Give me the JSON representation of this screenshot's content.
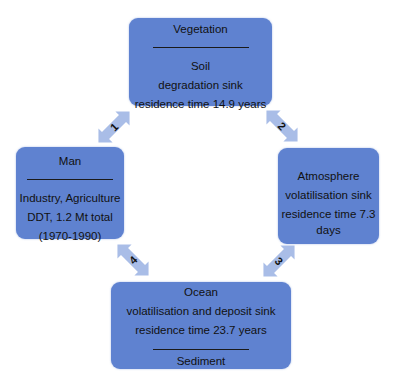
{
  "diagram": {
    "colors": {
      "box_fill": "#5f82d0",
      "arrow_fill": "#a9bde7",
      "text": "#111111"
    },
    "nodes": {
      "vegetation": {
        "title": "Vegetation",
        "lines": [
          "Soil",
          "degradation sink",
          "residence time 14.9 years"
        ]
      },
      "man": {
        "title": "Man",
        "lines": [
          "Industry, Agriculture",
          "DDT, 1.2 Mt total",
          "(1970-1990)"
        ]
      },
      "atmosphere": {
        "title": "Atmosphere",
        "lines": [
          "volatilisation sink",
          "residence time 7.3",
          "days"
        ]
      },
      "ocean": {
        "title": "Ocean",
        "lines": [
          "volatilisation and deposit sink",
          "residence time 23.7 years"
        ],
        "footer": "Sediment"
      }
    },
    "arrows": [
      {
        "id": "1",
        "label": "1",
        "from": "Man",
        "to": "Vegetation",
        "bidirectional": true
      },
      {
        "id": "2",
        "label": "2",
        "from": "Vegetation",
        "to": "Atmosphere",
        "bidirectional": true
      },
      {
        "id": "3",
        "label": "3",
        "from": "Atmosphere",
        "to": "Ocean",
        "bidirectional": true
      },
      {
        "id": "4",
        "label": "4",
        "from": "Ocean",
        "to": "Man",
        "bidirectional": true
      }
    ]
  }
}
